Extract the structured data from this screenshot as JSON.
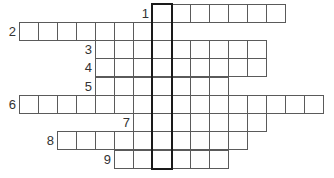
{
  "puzzle": {
    "type": "crossword",
    "cell_size": 19,
    "origin_x": 19,
    "rows": [
      {
        "number": "1",
        "y": 4,
        "start_col": 7,
        "end_col": 13
      },
      {
        "number": "2",
        "y": 22,
        "start_col": 0,
        "end_col": 7
      },
      {
        "number": "3",
        "y": 40,
        "start_col": 4,
        "end_col": 12
      },
      {
        "number": "4",
        "y": 58,
        "start_col": 4,
        "end_col": 12
      },
      {
        "number": "5",
        "y": 77,
        "start_col": 4,
        "end_col": 10
      },
      {
        "number": "6",
        "y": 95,
        "start_col": 0,
        "end_col": 15
      },
      {
        "number": "7",
        "y": 113,
        "start_col": 6,
        "end_col": 12
      },
      {
        "number": "8",
        "y": 131,
        "start_col": 2,
        "end_col": 11
      },
      {
        "number": "9",
        "y": 150,
        "start_col": 5,
        "end_col": 10
      }
    ],
    "highlight_column": 7,
    "cell_border_color": "#5a5a5a",
    "highlight_border_color": "#1a1a1a"
  }
}
